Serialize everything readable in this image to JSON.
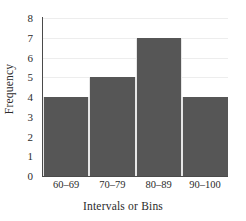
{
  "chart_data": {
    "type": "bar",
    "title": "",
    "subtitle": "",
    "xlabel": "Intervals or Bins",
    "ylabel": "Frequency",
    "categories": [
      "60–69",
      "70–79",
      "80–89",
      "90–100"
    ],
    "values": [
      4,
      5,
      7,
      4
    ],
    "ylim": [
      0,
      8
    ],
    "yticks": [
      0,
      1,
      2,
      3,
      4,
      5,
      6,
      7,
      8
    ],
    "ytick_labels": [
      "0",
      "1",
      "2",
      "3",
      "4",
      "5",
      "6",
      "7",
      "8"
    ],
    "grid": true,
    "grid_axis": "y",
    "legend": false,
    "legend_position": "none",
    "bar_color": "#565656",
    "bar_edge_color": "#e6e6e6",
    "axis_color": "#4a4a4a",
    "gridline_color": "#ededed",
    "text_color": "#2b2b2b",
    "background": "#ffffff",
    "annotations": []
  }
}
